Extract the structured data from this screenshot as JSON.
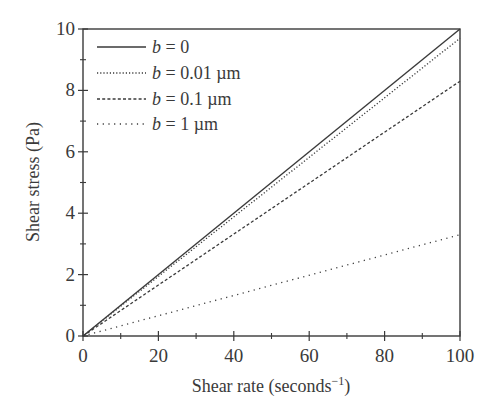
{
  "chart_data": {
    "type": "line",
    "title": "",
    "xlabel": "Shear rate (seconds",
    "xlabel_sup": "−1",
    "xlabel_close": ")",
    "ylabel": "Shear stress (Pa)",
    "xlim": [
      0,
      100
    ],
    "ylim": [
      0,
      10
    ],
    "xticks": [
      0,
      20,
      40,
      60,
      80,
      100
    ],
    "xticks_minor": [
      10,
      30,
      50,
      70,
      90
    ],
    "yticks": [
      0,
      2,
      4,
      6,
      8,
      10
    ],
    "yticks_minor": [
      1,
      3,
      5,
      7,
      9
    ],
    "grid": false,
    "legend_position": "upper left",
    "series": [
      {
        "name": "b = 0",
        "var": "b",
        "rest": " = 0",
        "style": "solid",
        "x": [
          0,
          100
        ],
        "y": [
          0,
          10.0
        ]
      },
      {
        "name": "b = 0.01 µm",
        "var": "b",
        "rest": " = 0.01 µm",
        "style": "dotted",
        "x": [
          0,
          100
        ],
        "y": [
          0,
          9.7
        ]
      },
      {
        "name": "b = 0.1 µm",
        "var": "b",
        "rest": " = 0.1 µm",
        "style": "dashed",
        "x": [
          0,
          100
        ],
        "y": [
          0,
          8.3
        ]
      },
      {
        "name": "b = 1 µm",
        "var": "b",
        "rest": " = 1 µm",
        "style": "sparse-dotted",
        "x": [
          0,
          100
        ],
        "y": [
          0,
          3.3
        ]
      }
    ]
  }
}
